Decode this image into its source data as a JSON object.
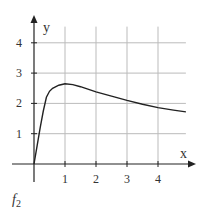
{
  "chart_data": {
    "type": "line",
    "title": "",
    "caption": "f2",
    "caption_main": "f",
    "caption_sub": "2",
    "xlabel": "x",
    "ylabel": "y",
    "xlim": [
      0,
      4.9
    ],
    "ylim": [
      0,
      4.6
    ],
    "xticks": [
      1,
      2,
      3,
      4
    ],
    "yticks": [
      1,
      2,
      3,
      4
    ],
    "xtick_labels": [
      "1",
      "2",
      "3",
      "4"
    ],
    "ytick_labels": [
      "1",
      "2",
      "3",
      "4"
    ],
    "grid": true,
    "series": [
      {
        "name": "f2",
        "x": [
          0,
          0.1,
          0.2,
          0.3,
          0.4,
          0.5,
          0.6,
          0.8,
          1.0,
          1.25,
          1.5,
          2.0,
          2.5,
          3.0,
          3.5,
          4.0,
          4.5,
          4.9
        ],
        "y": [
          0,
          0.6,
          1.2,
          1.75,
          2.2,
          2.4,
          2.5,
          2.6,
          2.65,
          2.62,
          2.55,
          2.38,
          2.24,
          2.1,
          1.97,
          1.86,
          1.78,
          1.72
        ]
      }
    ]
  },
  "colors": {
    "curve": "#222222",
    "axis": "#222222",
    "grid": "#bbbbbb"
  }
}
